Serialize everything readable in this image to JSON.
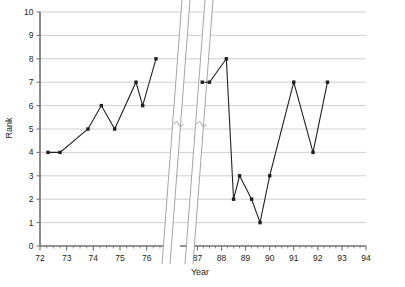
{
  "chart_data": {
    "type": "line",
    "title": "",
    "xlabel": "Year",
    "ylabel": "Rank",
    "ylim": [
      0,
      10
    ],
    "yticks": [
      0,
      1,
      2,
      3,
      4,
      5,
      6,
      7,
      8,
      9,
      10
    ],
    "grid": true,
    "legend": null,
    "axis_break": {
      "present": true,
      "between": [
        76.6,
        86.4
      ],
      "style": "double-slanted-break"
    },
    "x_axis_segments": [
      {
        "name": "early",
        "ticks": [
          72,
          73,
          74,
          75,
          76
        ],
        "minor_ticks_per_interval": 4
      },
      {
        "name": "late",
        "ticks": [
          87,
          88,
          89,
          90,
          91,
          92,
          93,
          94
        ],
        "minor_ticks_per_interval": 4
      }
    ],
    "series": [
      {
        "name": "Rank",
        "marker": "square",
        "color": "#231f20",
        "points_early": [
          {
            "x": 72.3,
            "y": 4
          },
          {
            "x": 72.75,
            "y": 4
          },
          {
            "x": 73.8,
            "y": 5
          },
          {
            "x": 74.3,
            "y": 6
          },
          {
            "x": 74.8,
            "y": 5
          },
          {
            "x": 75.6,
            "y": 7
          },
          {
            "x": 75.85,
            "y": 6
          },
          {
            "x": 76.35,
            "y": 8
          }
        ],
        "points_late": [
          {
            "x": 87.2,
            "y": 7
          },
          {
            "x": 87.5,
            "y": 7
          },
          {
            "x": 88.2,
            "y": 8
          },
          {
            "x": 88.5,
            "y": 2
          },
          {
            "x": 88.75,
            "y": 3
          },
          {
            "x": 89.25,
            "y": 2
          },
          {
            "x": 89.6,
            "y": 1
          },
          {
            "x": 90.0,
            "y": 3
          },
          {
            "x": 91.0,
            "y": 7
          },
          {
            "x": 91.8,
            "y": 4
          },
          {
            "x": 92.4,
            "y": 7
          }
        ]
      }
    ]
  },
  "axes": {
    "y_title": "Rank",
    "x_title": "Year",
    "y_tick_labels": [
      "0",
      "1",
      "2",
      "3",
      "4",
      "5",
      "6",
      "7",
      "8",
      "9",
      "10"
    ],
    "x_tick_labels_left": [
      "72",
      "73",
      "74",
      "75",
      "76"
    ],
    "x_tick_labels_right": [
      "87",
      "88",
      "89",
      "90",
      "91",
      "92",
      "93",
      "94"
    ]
  },
  "colors": {
    "line": "#231f20",
    "marker": "#231f20",
    "grid": "#c9c9c9",
    "axis": "#6f6f6f",
    "text": "#231f20",
    "background": "#ffffff"
  }
}
